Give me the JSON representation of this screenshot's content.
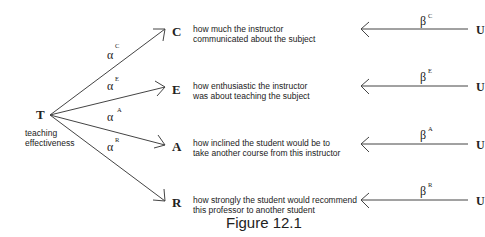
{
  "figure": {
    "caption": "Figure 12.1",
    "source_node": {
      "label": "T",
      "description_line1": "teaching",
      "description_line2": "effectiveness"
    },
    "indicators": [
      {
        "label": "C",
        "alpha": "α",
        "alpha_sup": "C",
        "beta": "β",
        "beta_sup": "C",
        "error": "U",
        "line1": "how much the instructor",
        "line2": "communicated about the subject"
      },
      {
        "label": "E",
        "alpha": "α",
        "alpha_sup": "E",
        "beta": "β",
        "beta_sup": "E",
        "error": "U",
        "line1": "how enthusiastic the instructor",
        "line2": "was about teaching the subject"
      },
      {
        "label": "A",
        "alpha": "α",
        "alpha_sup": "A",
        "beta": "β",
        "beta_sup": "A",
        "error": "U",
        "line1": "how inclined the student would be to",
        "line2": "take another course from this instructor"
      },
      {
        "label": "R",
        "alpha": "α",
        "alpha_sup": "R",
        "beta": "β",
        "beta_sup": "R",
        "error": "U",
        "line1": "how strongly the student would recommend",
        "line2": "this professor to another student"
      }
    ]
  }
}
